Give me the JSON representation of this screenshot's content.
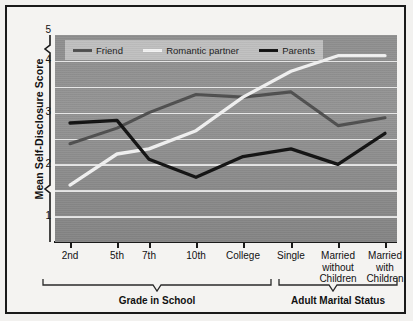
{
  "chart_data": {
    "type": "line",
    "title": "",
    "xlabel": "",
    "ylabel": "Mean Self-Disclosure Score",
    "ylim": [
      1,
      5
    ],
    "yticks": [
      1,
      2,
      3,
      4,
      5
    ],
    "ytick_labels": [
      "1",
      "2",
      "3",
      "4",
      "5"
    ],
    "gridlines": [
      1.5,
      2,
      2.5,
      3,
      3.5,
      4,
      4.5
    ],
    "grid": true,
    "axis_break": true,
    "legend_position": "top-left",
    "categories": [
      "2nd",
      "5th",
      "7th",
      "10th",
      "College",
      "Single",
      "Married without Children",
      "Married with Children"
    ],
    "series": [
      {
        "name": "Friend",
        "color": "#4f4f4f",
        "values": [
          2.9,
          3.2,
          3.5,
          3.85,
          3.8,
          3.9,
          3.25,
          3.4
        ]
      },
      {
        "name": "Romantic partner",
        "color": "#f2f2f2",
        "values": [
          2.1,
          2.7,
          2.8,
          3.15,
          3.8,
          4.3,
          4.6,
          4.6
        ]
      },
      {
        "name": "Parents",
        "color": "#121212",
        "values": [
          3.3,
          3.35,
          2.6,
          2.25,
          2.65,
          2.8,
          2.5,
          3.1
        ]
      }
    ],
    "groups": [
      {
        "label": "Grade in School",
        "categories": [
          "2nd",
          "5th",
          "7th",
          "10th",
          "College"
        ]
      },
      {
        "label": "Adult Marital Status",
        "categories": [
          "Single",
          "Married without Children",
          "Married with Children"
        ]
      }
    ]
  },
  "legend": {
    "items": [
      {
        "label": "Friend",
        "color": "#4f4f4f"
      },
      {
        "label": "Romantic partner",
        "color": "#f2f2f2"
      },
      {
        "label": "Parents",
        "color": "#121212"
      }
    ]
  },
  "axes": {
    "y_title": "Mean Self-Disclosure Score",
    "y_tick_labels": [
      "5",
      "4",
      "3",
      "2",
      "1"
    ],
    "x_tick_labels": [
      {
        "line1": "2nd",
        "line2": "",
        "line3": ""
      },
      {
        "line1": "5th",
        "line2": "",
        "line3": ""
      },
      {
        "line1": "7th",
        "line2": "",
        "line3": ""
      },
      {
        "line1": "10th",
        "line2": "",
        "line3": ""
      },
      {
        "line1": "College",
        "line2": "",
        "line3": ""
      },
      {
        "line1": "Single",
        "line2": "",
        "line3": ""
      },
      {
        "line1": "Married",
        "line2": "without",
        "line3": "Children"
      },
      {
        "line1": "Married",
        "line2": "with",
        "line3": "Children"
      }
    ]
  },
  "groups": {
    "grade": "Grade in School",
    "adult": "Adult Marital Status"
  },
  "colors": {
    "plot_background": "#909090",
    "gridline": "#ededed",
    "frame": "#1a1a1a",
    "page_background": "#f4f3f1",
    "friend": "#4f4f4f",
    "romantic_partner": "#f2f2f2",
    "parents": "#121212"
  }
}
